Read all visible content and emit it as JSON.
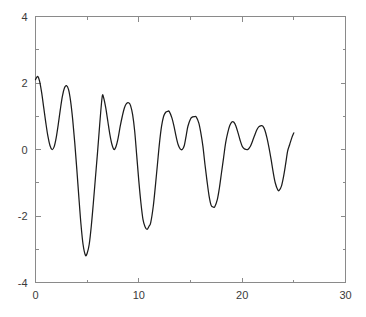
{
  "chart_data": {
    "type": "line",
    "title": "",
    "subtitle": "",
    "xlabel": "",
    "ylabel": "",
    "xlim": [
      0,
      30
    ],
    "ylim": [
      -4,
      4
    ],
    "xticks": [
      0,
      10,
      20,
      30
    ],
    "xtick_labels": [
      "0",
      "10",
      "20",
      "30"
    ],
    "xminor_ticks": [
      5,
      15,
      25
    ],
    "yticks": [
      -4,
      -2,
      0,
      2,
      4
    ],
    "ytick_labels": [
      "-4",
      "-2",
      "0",
      "2",
      "4"
    ],
    "yminor_ticks": [
      -3,
      -1,
      1,
      3
    ],
    "grid": false,
    "legend": null,
    "legend_position": "none",
    "annotations": [],
    "series": [
      {
        "name": "damped beat oscillation",
        "color": "#1c1c1c",
        "x_start": 0,
        "x_end": 25,
        "description": "Amplitude-modulated decaying oscillation: large initial swings damping toward smaller ripples by x=25.",
        "x": [
          0.0,
          0.2,
          0.4,
          0.6,
          0.8,
          1.0,
          1.2,
          1.4,
          1.6,
          1.8,
          2.0,
          2.2,
          2.4,
          2.6,
          2.8,
          3.0,
          3.2,
          3.4,
          3.6,
          3.8,
          4.0,
          4.2,
          4.4,
          4.6,
          4.83,
          5.0,
          5.2,
          5.4,
          5.6,
          5.8,
          6.0,
          6.2,
          6.45,
          6.6,
          6.8,
          7.0,
          7.2,
          7.4,
          7.6,
          7.8,
          8.0,
          8.2,
          8.4,
          8.6,
          8.8,
          9.05,
          9.2,
          9.4,
          9.6,
          9.8,
          10.0,
          10.2,
          10.4,
          10.6,
          10.8,
          11.0,
          11.15,
          11.4,
          11.6,
          11.8,
          12.0,
          12.2,
          12.4,
          12.6,
          12.8,
          12.95,
          13.2,
          13.4,
          13.6,
          13.8,
          14.0,
          14.2,
          14.4,
          14.6,
          14.75,
          15.0,
          15.2,
          15.4,
          15.55,
          15.8,
          16.0,
          16.2,
          16.4,
          16.6,
          16.8,
          17.0,
          17.2,
          17.35,
          17.6,
          17.8,
          18.0,
          18.2,
          18.4,
          18.6,
          18.8,
          19.0,
          19.2,
          19.4,
          19.6,
          19.8,
          20.0,
          20.2,
          20.4,
          20.55,
          20.8,
          21.0,
          21.2,
          21.4,
          21.6,
          21.85,
          22.0,
          22.2,
          22.4,
          22.6,
          22.8,
          23.0,
          23.2,
          23.45,
          23.6,
          23.8,
          24.0,
          24.2,
          24.4,
          24.6,
          24.8,
          25.0
        ],
        "y": [
          2.1,
          2.2,
          2.05,
          1.7,
          1.25,
          0.8,
          0.4,
          0.12,
          0.0,
          0.08,
          0.35,
          0.75,
          1.2,
          1.6,
          1.85,
          1.92,
          1.8,
          1.45,
          0.9,
          0.2,
          -0.6,
          -1.45,
          -2.25,
          -2.85,
          -3.18,
          -3.12,
          -2.85,
          -2.3,
          -1.6,
          -0.85,
          -0.1,
          0.7,
          1.58,
          1.55,
          1.25,
          0.85,
          0.45,
          0.15,
          0.0,
          0.1,
          0.35,
          0.7,
          1.0,
          1.25,
          1.38,
          1.4,
          1.32,
          1.05,
          0.55,
          -0.2,
          -0.95,
          -1.6,
          -2.1,
          -2.32,
          -2.4,
          -2.3,
          -2.2,
          -1.7,
          -1.1,
          -0.45,
          0.2,
          0.7,
          1.0,
          1.12,
          1.15,
          1.14,
          0.95,
          0.7,
          0.4,
          0.15,
          0.02,
          0.0,
          0.12,
          0.45,
          0.7,
          0.92,
          0.98,
          0.99,
          0.98,
          0.8,
          0.5,
          0.1,
          -0.45,
          -0.95,
          -1.4,
          -1.68,
          -1.73,
          -1.72,
          -1.5,
          -1.15,
          -0.7,
          -0.25,
          0.2,
          0.5,
          0.72,
          0.83,
          0.82,
          0.7,
          0.5,
          0.28,
          0.1,
          0.02,
          0.0,
          0.0,
          0.1,
          0.25,
          0.42,
          0.58,
          0.68,
          0.72,
          0.7,
          0.58,
          0.35,
          0.05,
          -0.3,
          -0.68,
          -1.0,
          -1.22,
          -1.22,
          -1.1,
          -0.82,
          -0.45,
          -0.05,
          0.15,
          0.35,
          0.5
        ]
      }
    ]
  },
  "figure": {
    "background_color": "#ffffff",
    "axis_color": "#8a8a8a",
    "label_color": "#3a3a3a",
    "line_color": "#1c1c1c"
  }
}
